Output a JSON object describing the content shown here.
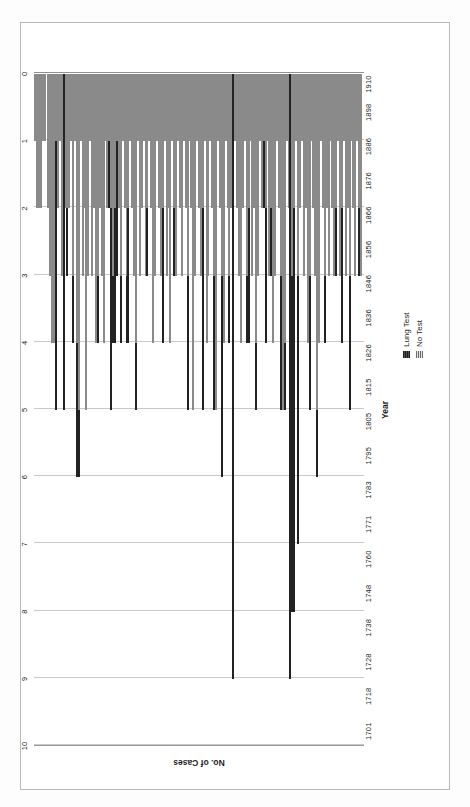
{
  "chart_data": {
    "type": "bar",
    "orientation": "horizontal-stacked",
    "title": "",
    "xlabel": "No. of Cases",
    "ylabel": "Year",
    "xlim": [
      0,
      10
    ],
    "xticks": [
      0,
      1,
      2,
      3,
      4,
      5,
      6,
      7,
      8,
      9,
      10
    ],
    "xtick_labels": [
      "0",
      "1",
      "2",
      "3",
      "4",
      "5",
      "6",
      "7",
      "8",
      "9",
      "10"
    ],
    "grid": true,
    "legend_position": "right",
    "legend": [
      "Lung Test",
      "No Test"
    ],
    "colors": {
      "lung_test": "#2f2f2f",
      "no_test": "#9d9d9d",
      "gridline": "#c9c9c9",
      "axis": "#8f8f8f",
      "frame": "#b9b9b9"
    },
    "categories": [
      "1701",
      "1718",
      "1728",
      "1738",
      "1748",
      "1760",
      "1771",
      "1783",
      "1795",
      "1805",
      "1815",
      "1826",
      "1836",
      "1846",
      "1856",
      "1866",
      "1876",
      "1886",
      "1898",
      "1910"
    ],
    "category_tick_positions": [
      0.022,
      0.074,
      0.125,
      0.176,
      0.227,
      0.278,
      0.33,
      0.381,
      0.432,
      0.483,
      0.534,
      0.585,
      0.637,
      0.688,
      0.739,
      0.79,
      0.841,
      0.892,
      0.943,
      0.985
    ],
    "series": [
      {
        "name": "No Test",
        "key": "no_test"
      },
      {
        "name": "Lung Test",
        "key": "lung_test"
      }
    ],
    "bars": [
      {
        "no_test": 1.0,
        "lung_test": 0.0
      },
      {
        "no_test": 2.0,
        "lung_test": 0.0
      },
      {
        "no_test": 2.0,
        "lung_test": 0.0
      },
      {
        "no_test": 2.0,
        "lung_test": 0.0
      },
      {
        "no_test": 1.0,
        "lung_test": 0.0
      },
      {
        "no_test": 1.0,
        "lung_test": 0.0
      },
      {
        "no_test": 0.0,
        "lung_test": 0.0
      },
      {
        "no_test": 2.0,
        "lung_test": 0.0
      },
      {
        "no_test": 3.0,
        "lung_test": 0.0
      },
      {
        "no_test": 4.0,
        "lung_test": 0.0
      },
      {
        "no_test": 4.0,
        "lung_test": 0.0
      },
      {
        "no_test": 1.0,
        "lung_test": 4.0
      },
      {
        "no_test": 2.0,
        "lung_test": 0.0
      },
      {
        "no_test": 1.0,
        "lung_test": 0.0
      },
      {
        "no_test": 3.0,
        "lung_test": 0.0
      },
      {
        "no_test": 0.0,
        "lung_test": 5.0
      },
      {
        "no_test": 2.0,
        "lung_test": 0.0
      },
      {
        "no_test": 2.0,
        "lung_test": 1.0
      },
      {
        "no_test": 2.0,
        "lung_test": 0.0
      },
      {
        "no_test": 1.0,
        "lung_test": 0.0
      },
      {
        "no_test": 3.0,
        "lung_test": 1.0
      },
      {
        "no_test": 1.0,
        "lung_test": 0.0
      },
      {
        "no_test": 4.0,
        "lung_test": 2.0
      },
      {
        "no_test": 5.0,
        "lung_test": 1.0
      },
      {
        "no_test": 1.0,
        "lung_test": 0.0
      },
      {
        "no_test": 3.0,
        "lung_test": 0.0
      },
      {
        "no_test": 2.0,
        "lung_test": 0.0
      },
      {
        "no_test": 5.0,
        "lung_test": 0.0
      },
      {
        "no_test": 3.0,
        "lung_test": 0.0
      },
      {
        "no_test": 1.0,
        "lung_test": 0.0
      },
      {
        "no_test": 3.0,
        "lung_test": 0.0
      },
      {
        "no_test": 2.0,
        "lung_test": 0.0
      },
      {
        "no_test": 4.0,
        "lung_test": 0.0
      },
      {
        "no_test": 3.0,
        "lung_test": 1.0
      },
      {
        "no_test": 2.0,
        "lung_test": 0.0
      },
      {
        "no_test": 3.0,
        "lung_test": 0.0
      },
      {
        "no_test": 4.0,
        "lung_test": 0.0
      },
      {
        "no_test": 1.0,
        "lung_test": 0.0
      },
      {
        "no_test": 2.0,
        "lung_test": 0.0
      },
      {
        "no_test": 1.0,
        "lung_test": 1.0
      },
      {
        "no_test": 2.0,
        "lung_test": 3.0
      },
      {
        "no_test": 3.0,
        "lung_test": 1.0
      },
      {
        "no_test": 2.0,
        "lung_test": 2.0
      },
      {
        "no_test": 1.0,
        "lung_test": 2.0
      },
      {
        "no_test": 2.0,
        "lung_test": 0.0
      },
      {
        "no_test": 3.0,
        "lung_test": 1.0
      },
      {
        "no_test": 1.0,
        "lung_test": 0.0
      },
      {
        "no_test": 2.0,
        "lung_test": 0.0
      },
      {
        "no_test": 3.0,
        "lung_test": 1.0
      },
      {
        "no_test": 2.0,
        "lung_test": 2.0
      },
      {
        "no_test": 1.0,
        "lung_test": 0.0
      },
      {
        "no_test": 2.0,
        "lung_test": 0.0
      },
      {
        "no_test": 3.0,
        "lung_test": 0.0
      },
      {
        "no_test": 4.0,
        "lung_test": 1.0
      },
      {
        "no_test": 1.0,
        "lung_test": 0.0
      },
      {
        "no_test": 3.0,
        "lung_test": 0.0
      },
      {
        "no_test": 2.0,
        "lung_test": 0.0
      },
      {
        "no_test": 1.0,
        "lung_test": 0.0
      },
      {
        "no_test": 3.0,
        "lung_test": 0.0
      },
      {
        "no_test": 2.0,
        "lung_test": 1.0
      },
      {
        "no_test": 1.0,
        "lung_test": 0.0
      },
      {
        "no_test": 2.0,
        "lung_test": 0.0
      },
      {
        "no_test": 4.0,
        "lung_test": 0.0
      },
      {
        "no_test": 3.0,
        "lung_test": 0.0
      },
      {
        "no_test": 1.0,
        "lung_test": 0.0
      },
      {
        "no_test": 2.0,
        "lung_test": 0.0
      },
      {
        "no_test": 3.0,
        "lung_test": 0.0
      },
      {
        "no_test": 2.0,
        "lung_test": 2.0
      },
      {
        "no_test": 1.0,
        "lung_test": 0.0
      },
      {
        "no_test": 3.0,
        "lung_test": 0.0
      },
      {
        "no_test": 2.0,
        "lung_test": 0.0
      },
      {
        "no_test": 4.0,
        "lung_test": 0.0
      },
      {
        "no_test": 1.0,
        "lung_test": 0.0
      },
      {
        "no_test": 2.0,
        "lung_test": 1.0
      },
      {
        "no_test": 3.0,
        "lung_test": 0.0
      },
      {
        "no_test": 1.0,
        "lung_test": 0.0
      },
      {
        "no_test": 2.0,
        "lung_test": 0.0
      },
      {
        "no_test": 3.0,
        "lung_test": 0.0
      },
      {
        "no_test": 1.0,
        "lung_test": 0.0
      },
      {
        "no_test": 2.0,
        "lung_test": 0.0
      },
      {
        "no_test": 3.0,
        "lung_test": 2.0
      },
      {
        "no_test": 1.0,
        "lung_test": 0.0
      },
      {
        "no_test": 2.0,
        "lung_test": 0.0
      },
      {
        "no_test": 5.0,
        "lung_test": 0.0
      },
      {
        "no_test": 3.0,
        "lung_test": 0.0
      },
      {
        "no_test": 1.0,
        "lung_test": 0.0
      },
      {
        "no_test": 2.0,
        "lung_test": 0.0
      },
      {
        "no_test": 3.0,
        "lung_test": 0.0
      },
      {
        "no_test": 2.0,
        "lung_test": 3.0
      },
      {
        "no_test": 1.0,
        "lung_test": 0.0
      },
      {
        "no_test": 4.0,
        "lung_test": 0.0
      },
      {
        "no_test": 3.0,
        "lung_test": 0.0
      },
      {
        "no_test": 1.0,
        "lung_test": 0.0
      },
      {
        "no_test": 2.0,
        "lung_test": 0.0
      },
      {
        "no_test": 3.0,
        "lung_test": 2.0
      },
      {
        "no_test": 5.0,
        "lung_test": 0.0
      },
      {
        "no_test": 1.0,
        "lung_test": 0.0
      },
      {
        "no_test": 2.0,
        "lung_test": 0.0
      },
      {
        "no_test": 3.0,
        "lung_test": 3.0
      },
      {
        "no_test": 4.0,
        "lung_test": 0.0
      },
      {
        "no_test": 1.0,
        "lung_test": 0.0
      },
      {
        "no_test": 2.0,
        "lung_test": 0.0
      },
      {
        "no_test": 3.0,
        "lung_test": 1.0
      },
      {
        "no_test": 2.0,
        "lung_test": 0.0
      },
      {
        "no_test": 0.0,
        "lung_test": 9.0
      },
      {
        "no_test": 1.0,
        "lung_test": 0.0
      },
      {
        "no_test": 2.0,
        "lung_test": 0.0
      },
      {
        "no_test": 3.0,
        "lung_test": 0.0
      },
      {
        "no_test": 4.0,
        "lung_test": 0.0
      },
      {
        "no_test": 2.0,
        "lung_test": 0.0
      },
      {
        "no_test": 1.0,
        "lung_test": 0.0
      },
      {
        "no_test": 3.0,
        "lung_test": 1.0
      },
      {
        "no_test": 2.0,
        "lung_test": 2.0
      },
      {
        "no_test": 1.0,
        "lung_test": 0.0
      },
      {
        "no_test": 3.0,
        "lung_test": 0.0
      },
      {
        "no_test": 2.0,
        "lung_test": 0.0
      },
      {
        "no_test": 4.0,
        "lung_test": 1.0
      },
      {
        "no_test": 3.0,
        "lung_test": 0.0
      },
      {
        "no_test": 1.0,
        "lung_test": 0.0
      },
      {
        "no_test": 2.0,
        "lung_test": 0.0
      },
      {
        "no_test": 1.0,
        "lung_test": 1.0
      },
      {
        "no_test": 2.0,
        "lung_test": 2.0
      },
      {
        "no_test": 1.0,
        "lung_test": 0.0
      },
      {
        "no_test": 3.0,
        "lung_test": 0.0
      },
      {
        "no_test": 2.0,
        "lung_test": 1.0
      },
      {
        "no_test": 4.0,
        "lung_test": 0.0
      },
      {
        "no_test": 3.0,
        "lung_test": 0.0
      },
      {
        "no_test": 1.0,
        "lung_test": 0.0
      },
      {
        "no_test": 2.0,
        "lung_test": 0.0
      },
      {
        "no_test": 3.0,
        "lung_test": 2.0
      },
      {
        "no_test": 5.0,
        "lung_test": 0.0
      },
      {
        "no_test": 4.0,
        "lung_test": 1.0
      },
      {
        "no_test": 1.0,
        "lung_test": 0.0
      },
      {
        "no_test": 2.0,
        "lung_test": 0.0
      },
      {
        "no_test": 0.0,
        "lung_test": 9.0
      },
      {
        "no_test": 3.0,
        "lung_test": 5.0
      },
      {
        "no_test": 2.0,
        "lung_test": 6.0
      },
      {
        "no_test": 1.0,
        "lung_test": 0.0
      },
      {
        "no_test": 3.0,
        "lung_test": 4.0
      },
      {
        "no_test": 2.0,
        "lung_test": 0.0
      },
      {
        "no_test": 1.0,
        "lung_test": 0.0
      },
      {
        "no_test": 3.0,
        "lung_test": 0.0
      },
      {
        "no_test": 2.0,
        "lung_test": 0.0
      },
      {
        "no_test": 4.0,
        "lung_test": 0.0
      },
      {
        "no_test": 3.0,
        "lung_test": 2.0
      },
      {
        "no_test": 1.0,
        "lung_test": 0.0
      },
      {
        "no_test": 2.0,
        "lung_test": 0.0
      },
      {
        "no_test": 3.0,
        "lung_test": 0.0
      },
      {
        "no_test": 5.0,
        "lung_test": 1.0
      },
      {
        "no_test": 4.0,
        "lung_test": 0.0
      },
      {
        "no_test": 1.0,
        "lung_test": 0.0
      },
      {
        "no_test": 2.0,
        "lung_test": 0.0
      },
      {
        "no_test": 3.0,
        "lung_test": 1.0
      },
      {
        "no_test": 2.0,
        "lung_test": 0.0
      },
      {
        "no_test": 3.0,
        "lung_test": 0.0
      },
      {
        "no_test": 1.0,
        "lung_test": 0.0
      },
      {
        "no_test": 2.0,
        "lung_test": 0.0
      },
      {
        "no_test": 3.0,
        "lung_test": 0.0
      },
      {
        "no_test": 2.0,
        "lung_test": 1.0
      },
      {
        "no_test": 1.0,
        "lung_test": 0.0
      },
      {
        "no_test": 3.0,
        "lung_test": 0.0
      },
      {
        "no_test": 2.0,
        "lung_test": 2.0
      },
      {
        "no_test": 1.0,
        "lung_test": 0.0
      },
      {
        "no_test": 3.0,
        "lung_test": 0.0
      },
      {
        "no_test": 2.0,
        "lung_test": 0.0
      },
      {
        "no_test": 3.0,
        "lung_test": 2.0
      },
      {
        "no_test": 1.0,
        "lung_test": 0.0
      },
      {
        "no_test": 2.0,
        "lung_test": 0.0
      },
      {
        "no_test": 3.0,
        "lung_test": 0.0
      },
      {
        "no_test": 1.0,
        "lung_test": 0.0
      },
      {
        "no_test": 2.0,
        "lung_test": 1.0
      },
      {
        "no_test": 3.0,
        "lung_test": 0.0
      }
    ]
  }
}
